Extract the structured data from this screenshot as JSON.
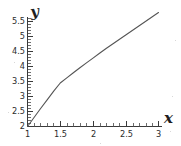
{
  "chart_data": {
    "type": "line",
    "title": "",
    "xlabel": "x",
    "ylabel": "y",
    "xlim": [
      1,
      3
    ],
    "ylim": [
      2,
      5.9
    ],
    "grid": false,
    "legend": null,
    "x_ticks": [
      "1",
      "1.5",
      "2",
      "2.5",
      "3"
    ],
    "x_tick_values": [
      1,
      1.5,
      2,
      2.5,
      3
    ],
    "x_minor_step": 0.1,
    "y_ticks": [
      "2",
      "2.5",
      "3",
      "3.5",
      "4",
      "4.5",
      "5",
      "5.5"
    ],
    "y_tick_values": [
      2,
      2.5,
      3,
      3.5,
      4,
      4.5,
      5,
      5.5
    ],
    "y_minor_step": 0.1,
    "series": [
      {
        "name": "curve",
        "color": "#555555",
        "x": [
          1.0,
          1.1,
          1.2,
          1.3,
          1.4,
          1.5,
          1.6,
          1.7,
          1.8,
          1.9,
          2.0,
          2.1,
          2.2,
          2.3,
          2.4,
          2.5,
          2.6,
          2.7,
          2.8,
          2.9,
          3.0
        ],
        "y": [
          2.0,
          2.3,
          2.6,
          2.89,
          3.18,
          3.45,
          3.62,
          3.79,
          3.96,
          4.12,
          4.28,
          4.44,
          4.6,
          4.75,
          4.9,
          5.05,
          5.2,
          5.35,
          5.5,
          5.65,
          5.8
        ]
      }
    ]
  },
  "axis_labels": {
    "x_name": "x",
    "y_name": "y"
  },
  "icons": {
    "x_axis_label_glyph": "x-axis-label-handwritten",
    "y_axis_label_glyph": "y-axis-label-handwritten"
  },
  "colors": {
    "curve": "#555555",
    "axis": "#3a3a3a",
    "text": "#2b2b2b",
    "background": "#ffffff"
  }
}
